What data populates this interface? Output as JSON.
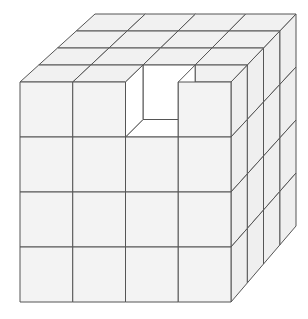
{
  "diagram": {
    "grid_size": 4,
    "removed_cubes": [
      {
        "col": 2,
        "row": 0,
        "layer": 0
      }
    ],
    "colors": {
      "face": "#f3f3f3",
      "side_face": "#efefef",
      "top_face": "#f1f1f1",
      "hole": "#ffffff",
      "edge": "#555555"
    },
    "geometry": {
      "front_left": 20,
      "front_top": 82,
      "front_right": 231,
      "front_bottom": 302,
      "back_left": 95,
      "back_top": 14,
      "back_right": 296,
      "back_bottom": 226
    }
  }
}
